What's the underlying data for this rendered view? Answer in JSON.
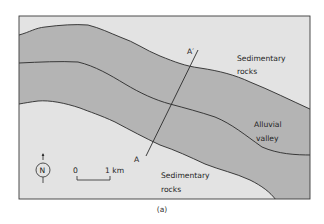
{
  "figure": {
    "caption": "(a)",
    "colors": {
      "sedimentary_fill": "#e3e3e3",
      "alluvial_fill": "#b4b4b4",
      "border": "#3a3a3a",
      "line": "#2a2a2a"
    }
  },
  "map": {
    "regions": [
      {
        "name": "Sedimentary rocks",
        "position": "north"
      },
      {
        "name": "Alluvial valley",
        "position": "center"
      },
      {
        "name": "Sedimentary rocks",
        "position": "south"
      }
    ],
    "labels": {
      "sedimentary_north_line1": "Sedimentary",
      "sedimentary_north_line2": "rocks",
      "alluvial_line1": "Alluvial",
      "alluvial_line2": "valley",
      "sedimentary_south_line1": "Sedimentary",
      "sedimentary_south_line2": "rocks"
    },
    "cross_section": {
      "start_label": "A",
      "end_label": "A′"
    },
    "north_arrow": {
      "label": "N"
    },
    "scale_bar": {
      "start": "0",
      "end": "1 km"
    }
  }
}
